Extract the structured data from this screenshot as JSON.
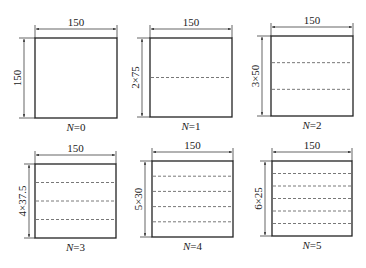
{
  "figure": {
    "colors": {
      "line": "#222222",
      "dash": "#555555",
      "background": "#ffffff"
    },
    "panels": [
      {
        "id": "n0",
        "width_label": "150",
        "height_label": "150",
        "caption_var": "N",
        "caption_val": "=0",
        "layers": 1,
        "box": {
          "x": 35,
          "y": 38,
          "w": 82,
          "h": 80
        },
        "dim_left_x": 24
      },
      {
        "id": "n1",
        "width_label": "150",
        "height_label": "2×75",
        "caption_var": "N",
        "caption_val": "=1",
        "layers": 2,
        "box": {
          "x": 150,
          "y": 38,
          "w": 82,
          "h": 79
        },
        "dim_left_x": 142
      },
      {
        "id": "n2",
        "width_label": "150",
        "height_label": "3×50",
        "caption_var": "N",
        "caption_val": "=2",
        "layers": 3,
        "box": {
          "x": 271,
          "y": 36,
          "w": 82,
          "h": 80
        },
        "dim_left_x": 262
      },
      {
        "id": "n3",
        "width_label": "150",
        "height_label": "4×37.5",
        "caption_var": "N",
        "caption_val": "=3",
        "layers": 4,
        "box": {
          "x": 35,
          "y": 164,
          "w": 81,
          "h": 74
        },
        "dim_left_x": 29
      },
      {
        "id": "n4",
        "width_label": "150",
        "height_label": "5×30",
        "caption_var": "N",
        "caption_val": "=4",
        "layers": 5,
        "box": {
          "x": 152,
          "y": 161,
          "w": 81,
          "h": 76
        },
        "dim_left_x": 145
      },
      {
        "id": "n5",
        "width_label": "150",
        "height_label": "6×25",
        "caption_var": "N",
        "caption_val": "=5",
        "layers": 6,
        "box": {
          "x": 272,
          "y": 161,
          "w": 80,
          "h": 75
        },
        "dim_left_x": 265
      }
    ]
  }
}
